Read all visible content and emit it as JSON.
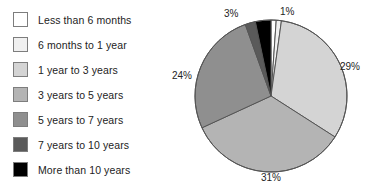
{
  "legend": {
    "items": [
      {
        "label": "Less than 6 months",
        "color": "#ffffff"
      },
      {
        "label": "6 months to 1 year",
        "color": "#f0f0f0"
      },
      {
        "label": "1 year to 3 years",
        "color": "#d4d4d4"
      },
      {
        "label": "3 years to 5 years",
        "color": "#b4b4b4"
      },
      {
        "label": "5 years to 7 years",
        "color": "#8f8f8f"
      },
      {
        "label": "7 years to 10 years",
        "color": "#5a5a5a"
      },
      {
        "label": "More than 10 years",
        "color": "#000000"
      }
    ]
  },
  "chart_data": {
    "type": "pie",
    "title": "",
    "legend_position": "left",
    "start_angle_deg": 0,
    "direction": "clockwise",
    "categories": [
      "Less than 6 months",
      "6 months to 1 year",
      "1 year to 3 years",
      "3 years to 5 years",
      "5 years to 7 years",
      "7 years to 10 years",
      "More than 10 years"
    ],
    "values": [
      1,
      1,
      29,
      31,
      24,
      2,
      3
    ],
    "unit": "%",
    "colors": [
      "#ffffff",
      "#f0f0f0",
      "#d4d4d4",
      "#b4b4b4",
      "#8f8f8f",
      "#5a5a5a",
      "#000000"
    ],
    "slice_border_color": "#555555",
    "data_labels": [
      {
        "text": "1%",
        "category": "Less than 6 months",
        "x": 108,
        "y": 6
      },
      {
        "text": "29%",
        "category": "1 year to 3 years",
        "x": 168,
        "y": 61
      },
      {
        "text": "31%",
        "category": "3 years to 5 years",
        "x": 89,
        "y": 172
      },
      {
        "text": "24%",
        "category": "5 years to 7 years",
        "x": 0,
        "y": 70
      },
      {
        "text": "3%",
        "category": "More than 10 years",
        "x": 52,
        "y": 8
      }
    ]
  },
  "pie_geometry": {
    "cx": 99,
    "cy": 96,
    "r": 76
  }
}
